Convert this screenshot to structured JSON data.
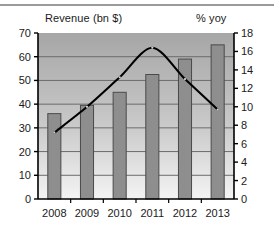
{
  "chart_data": {
    "type": "bar",
    "title": "",
    "categories": [
      "2008",
      "2009",
      "2010",
      "2011",
      "2012",
      "2013"
    ],
    "series": [
      {
        "name": "Revenue (bn $)",
        "type": "bar",
        "axis": "left",
        "values": [
          36,
          39.5,
          45,
          52.5,
          59,
          65
        ]
      },
      {
        "name": "% yoy",
        "type": "line",
        "axis": "right",
        "values": [
          7.2,
          10.0,
          13.2,
          16.4,
          13.0,
          9.7
        ]
      }
    ],
    "left_axis": {
      "label": "Revenue (bn $)",
      "ticks": [
        0,
        10,
        20,
        30,
        40,
        50,
        60,
        70
      ],
      "ylim": [
        0,
        70
      ]
    },
    "right_axis": {
      "label": "% yoy",
      "ticks": [
        0,
        2,
        4,
        6,
        8,
        10,
        12,
        14,
        16,
        18
      ],
      "ylim": [
        0,
        18
      ]
    },
    "xlabel": "",
    "grid": true,
    "legend": "none",
    "colors": {
      "bar_fill": "#8e8e8e",
      "bar_edge": "#4a4a4a",
      "line": "#000000",
      "plot_bg_top": "#a6a6a6",
      "plot_bg_bottom": "#f2f2f2",
      "gridline": "#6b6b6b",
      "axis": "#000000",
      "top_rule": "#9a9a9a"
    }
  },
  "titles": {
    "left": "Revenue (bn $)",
    "right": "% yoy"
  },
  "axis_ticks": {
    "left": [
      "70",
      "60",
      "50",
      "40",
      "30",
      "20",
      "10",
      "0"
    ],
    "right": [
      "18",
      "16",
      "14",
      "12",
      "10",
      "8",
      "6",
      "4",
      "2",
      "0"
    ]
  }
}
